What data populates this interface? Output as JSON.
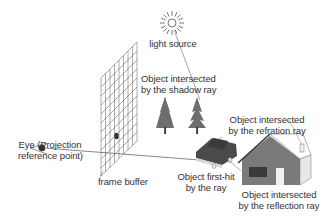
{
  "diagram": {
    "type": "ray-tracing-illustration",
    "labels": {
      "light_source": "light source",
      "shadow_line1": "Object intersected",
      "shadow_line2": "by the shadow ray",
      "refraction_line1": "Object intersected",
      "refraction_line2": "by the refration ray",
      "eye_line1": "Eye (Projection",
      "eye_line2": "reference point)",
      "frame_buffer": "frame buffer",
      "firsthit_line1": "Object first-hit",
      "firsthit_line2": "by the ray",
      "reflection_line1": "Object intersected",
      "reflection_line2": "by the reflection ray"
    },
    "objects": [
      {
        "id": "light-source",
        "icon": "sun-icon"
      },
      {
        "id": "frame-buffer",
        "icon": "grid-icon"
      },
      {
        "id": "eye",
        "icon": "eye-icon"
      },
      {
        "id": "trees",
        "icon": "tree-icon",
        "count": 2
      },
      {
        "id": "car",
        "icon": "car-icon"
      },
      {
        "id": "house",
        "icon": "house-icon"
      }
    ],
    "colors": {
      "line": "#555555",
      "object_fill": "#6e6e6e",
      "dark_fill": "#4a4a4a",
      "light_fill": "#dcdcdc",
      "text": "#333333"
    }
  }
}
